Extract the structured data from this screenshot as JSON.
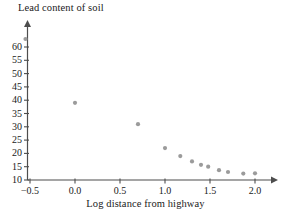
{
  "chart_data": {
    "type": "scatter",
    "title": "Lead content of soil",
    "xlabel": "Log distance from highway",
    "ylabel": "",
    "xlim": [
      -0.75,
      2.25
    ],
    "ylim": [
      10,
      65
    ],
    "grid": false,
    "legend": null,
    "xticks": [
      -0.5,
      0.0,
      0.5,
      1.0,
      1.5,
      2.0
    ],
    "xtick_labels": [
      "−0.5",
      "0.0",
      "0.5",
      "1.0",
      "1.5",
      "2.0"
    ],
    "yticks": [
      10,
      15,
      20,
      25,
      30,
      35,
      40,
      45,
      50,
      55,
      60
    ],
    "ytick_labels": [
      "10",
      "15",
      "20",
      "25",
      "30",
      "35",
      "40",
      "45",
      "50",
      "55",
      "60"
    ],
    "marker": {
      "shape": "circle",
      "color": "#9b9b9b",
      "radius": 2.1
    },
    "axis_color": "#4d4d4d",
    "series": [
      {
        "name": "Lead content vs log distance",
        "points": [
          {
            "x": -0.55,
            "y": 63.0
          },
          {
            "x": 0.0,
            "y": 39.0
          },
          {
            "x": 0.7,
            "y": 31.0
          },
          {
            "x": 1.0,
            "y": 22.0
          },
          {
            "x": 1.17,
            "y": 19.0
          },
          {
            "x": 1.3,
            "y": 17.0
          },
          {
            "x": 1.4,
            "y": 15.7
          },
          {
            "x": 1.48,
            "y": 15.0
          },
          {
            "x": 1.6,
            "y": 13.7
          },
          {
            "x": 1.7,
            "y": 13.0
          },
          {
            "x": 1.87,
            "y": 12.4
          },
          {
            "x": 2.0,
            "y": 12.5
          }
        ]
      }
    ]
  }
}
